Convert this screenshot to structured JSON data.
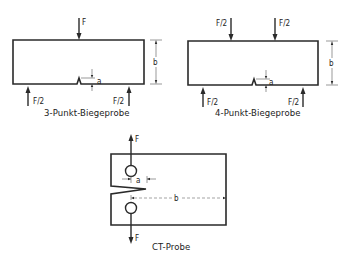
{
  "diagram": {
    "specimens": [
      {
        "id": "three-point",
        "caption": "3-Punkt-Biegeprobe",
        "load_top": "F",
        "support_left": "F/2",
        "support_right": "F/2",
        "dim_notch": "a",
        "dim_height": "b"
      },
      {
        "id": "four-point",
        "caption": "4-Punkt-Biegeprobe",
        "load_top_left": "F/2",
        "load_top_right": "F/2",
        "support_left": "F/2",
        "support_right": "F/2",
        "dim_notch": "a",
        "dim_height": "b"
      },
      {
        "id": "compact-tension",
        "caption": "CT-Probe",
        "load_top": "F",
        "load_bottom": "F",
        "dim_notch": "a",
        "dim_width": "b"
      }
    ],
    "colors": {
      "line": "#2a2a2a",
      "background": "#ffffff"
    }
  }
}
